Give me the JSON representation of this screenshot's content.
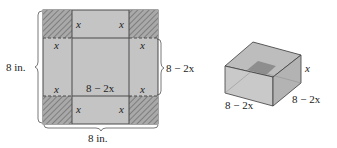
{
  "flat_sheet": {
    "side_label_left": "8 in.",
    "side_label_bottom": "8 in.",
    "inner_side_label_right": "8 − 2x",
    "inner_side_label_center": "8 − 2x",
    "corner_label": "x",
    "colors": {
      "sheet_fill": "#c4c4c4",
      "corner_fill": "#a9a9a9",
      "hatch": "#6a6a6a",
      "outline": "#4a4a4a"
    }
  },
  "box": {
    "height_label": "x",
    "width_label_front": "8 − 2x",
    "depth_label_right": "8 − 2x",
    "colors": {
      "front_face": "#c9c9c9",
      "side_face": "#b3b3b3",
      "inside": "#bcbcbc",
      "inner_floor": "#8e8e8e",
      "edge": "#3d3d3d"
    }
  }
}
